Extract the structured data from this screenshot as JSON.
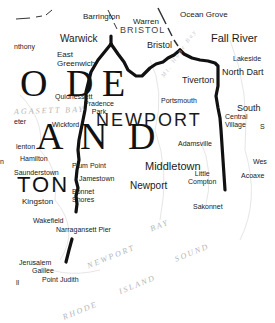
{
  "map": {
    "region": "Narragansett Bay",
    "places": {
      "ocean_grove": "Ocean Grove",
      "barrington": "Barrington",
      "warren": "Warren",
      "bristol_county": "BRISTOL",
      "warwick": "Warwick",
      "bristol": "Bristol",
      "fall_river": "Fall River",
      "anthony": "nthony",
      "east_greenwich": "East\nGreenwich",
      "lakeside": "Lakeside",
      "tiverton": "Tiverton",
      "north_dartmouth": "North Dart",
      "quidnessett": "Quidnessett",
      "providence_park": "Pradence\nPark",
      "portsmouth": "Portsmouth",
      "wickford": "Wickford",
      "newport_county": "NEWPORT",
      "south": "South",
      "central_village": "Central\nVillage",
      "s_partial": "S",
      "hamilton": "Hamilton",
      "allenton": "lenton",
      "adamsville": "Adamsville",
      "west_partial": "Wes",
      "saunderstown": "Saunderstown",
      "plum_point": "Plum Point",
      "middletown": "Middletown",
      "little_compton": "Little\nCompton",
      "acoaxet": "Acoaxe",
      "jamestown": "Jamestown",
      "newport": "Newport",
      "bonnet_shores": "Bonnet\nShores",
      "kingston": "Kingston",
      "sakonnet": "Sakonnet",
      "wakefield": "Wakefield",
      "narragansett_pier": "Narragansett Pier",
      "jerusalem": "Jerusalem",
      "galilee": "Galilee",
      "point_judith": "Point Judith",
      "peter_partial": "eter",
      "n_partial": "n",
      "ll_partial": "ll"
    },
    "big_letters": {
      "rhode_row": [
        "O",
        "D",
        "E"
      ],
      "island_row": [
        "A",
        "N",
        "D"
      ],
      "washington_row": "TON"
    },
    "water_labels": {
      "narragansett_bay_faint": "AGASETT BAY",
      "newport": "NEWPORT",
      "bay": "BAY",
      "sound": "SOUND",
      "island": "ISLAND",
      "rhode": "RHODE",
      "mt_hope_bay": "Mt. Hope Bay"
    },
    "colors": {
      "route_line": "#111111",
      "text": "#1a1a1a",
      "water_text": "#b5b5b5",
      "background": "#ffffff"
    }
  }
}
